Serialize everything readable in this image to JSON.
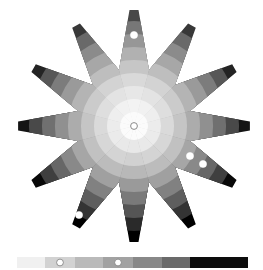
{
  "caption": "... value scale ... ",
  "wheel": {
    "center": [
      134,
      126
    ],
    "points": 12,
    "outer_radius": 116,
    "inner_radius": 58,
    "tip_half_width_deg": 2.2,
    "ring_radii": [
      14,
      27,
      40,
      53,
      66,
      79,
      92,
      105,
      118
    ],
    "ring_grays": [
      "#fbfbfb",
      "#eeeeee",
      "#dedede",
      "#cbcbcb",
      "#b4b4b4",
      "#9a9a9a",
      "#7c7c7c",
      "#575757",
      "#242424"
    ],
    "sector_offsets": [
      18,
      10,
      0,
      -8,
      -14,
      -20,
      -26,
      -20,
      -14,
      -8,
      0,
      10
    ],
    "markers": [
      {
        "name": "center-marker",
        "x": 134,
        "y": 126,
        "r": 3.4,
        "ring": true
      },
      {
        "name": "top-arm-marker",
        "x": 134,
        "y": 35,
        "r": 3.6,
        "ring": false
      },
      {
        "name": "right-arm-marker-1",
        "x": 190,
        "y": 156,
        "r": 3.6,
        "ring": false
      },
      {
        "name": "right-arm-marker-2",
        "x": 203,
        "y": 164,
        "r": 3.6,
        "ring": false
      },
      {
        "name": "bottom-left-arm-marker",
        "x": 79,
        "y": 215,
        "r": 3.6,
        "ring": false
      }
    ]
  },
  "scale_bar": {
    "x": 17,
    "y": 257,
    "height": 11,
    "segments": [
      {
        "width": 28,
        "color": "#f0f0f0"
      },
      {
        "width": 30,
        "color": "#d2d2d2",
        "marker": true
      },
      {
        "width": 28,
        "color": "#bababa"
      },
      {
        "width": 30,
        "color": "#a2a2a2",
        "marker": true
      },
      {
        "width": 29,
        "color": "#888888"
      },
      {
        "width": 28,
        "color": "#6a6a6a"
      },
      {
        "width": 58,
        "color": "#0c0c0c"
      }
    ]
  }
}
